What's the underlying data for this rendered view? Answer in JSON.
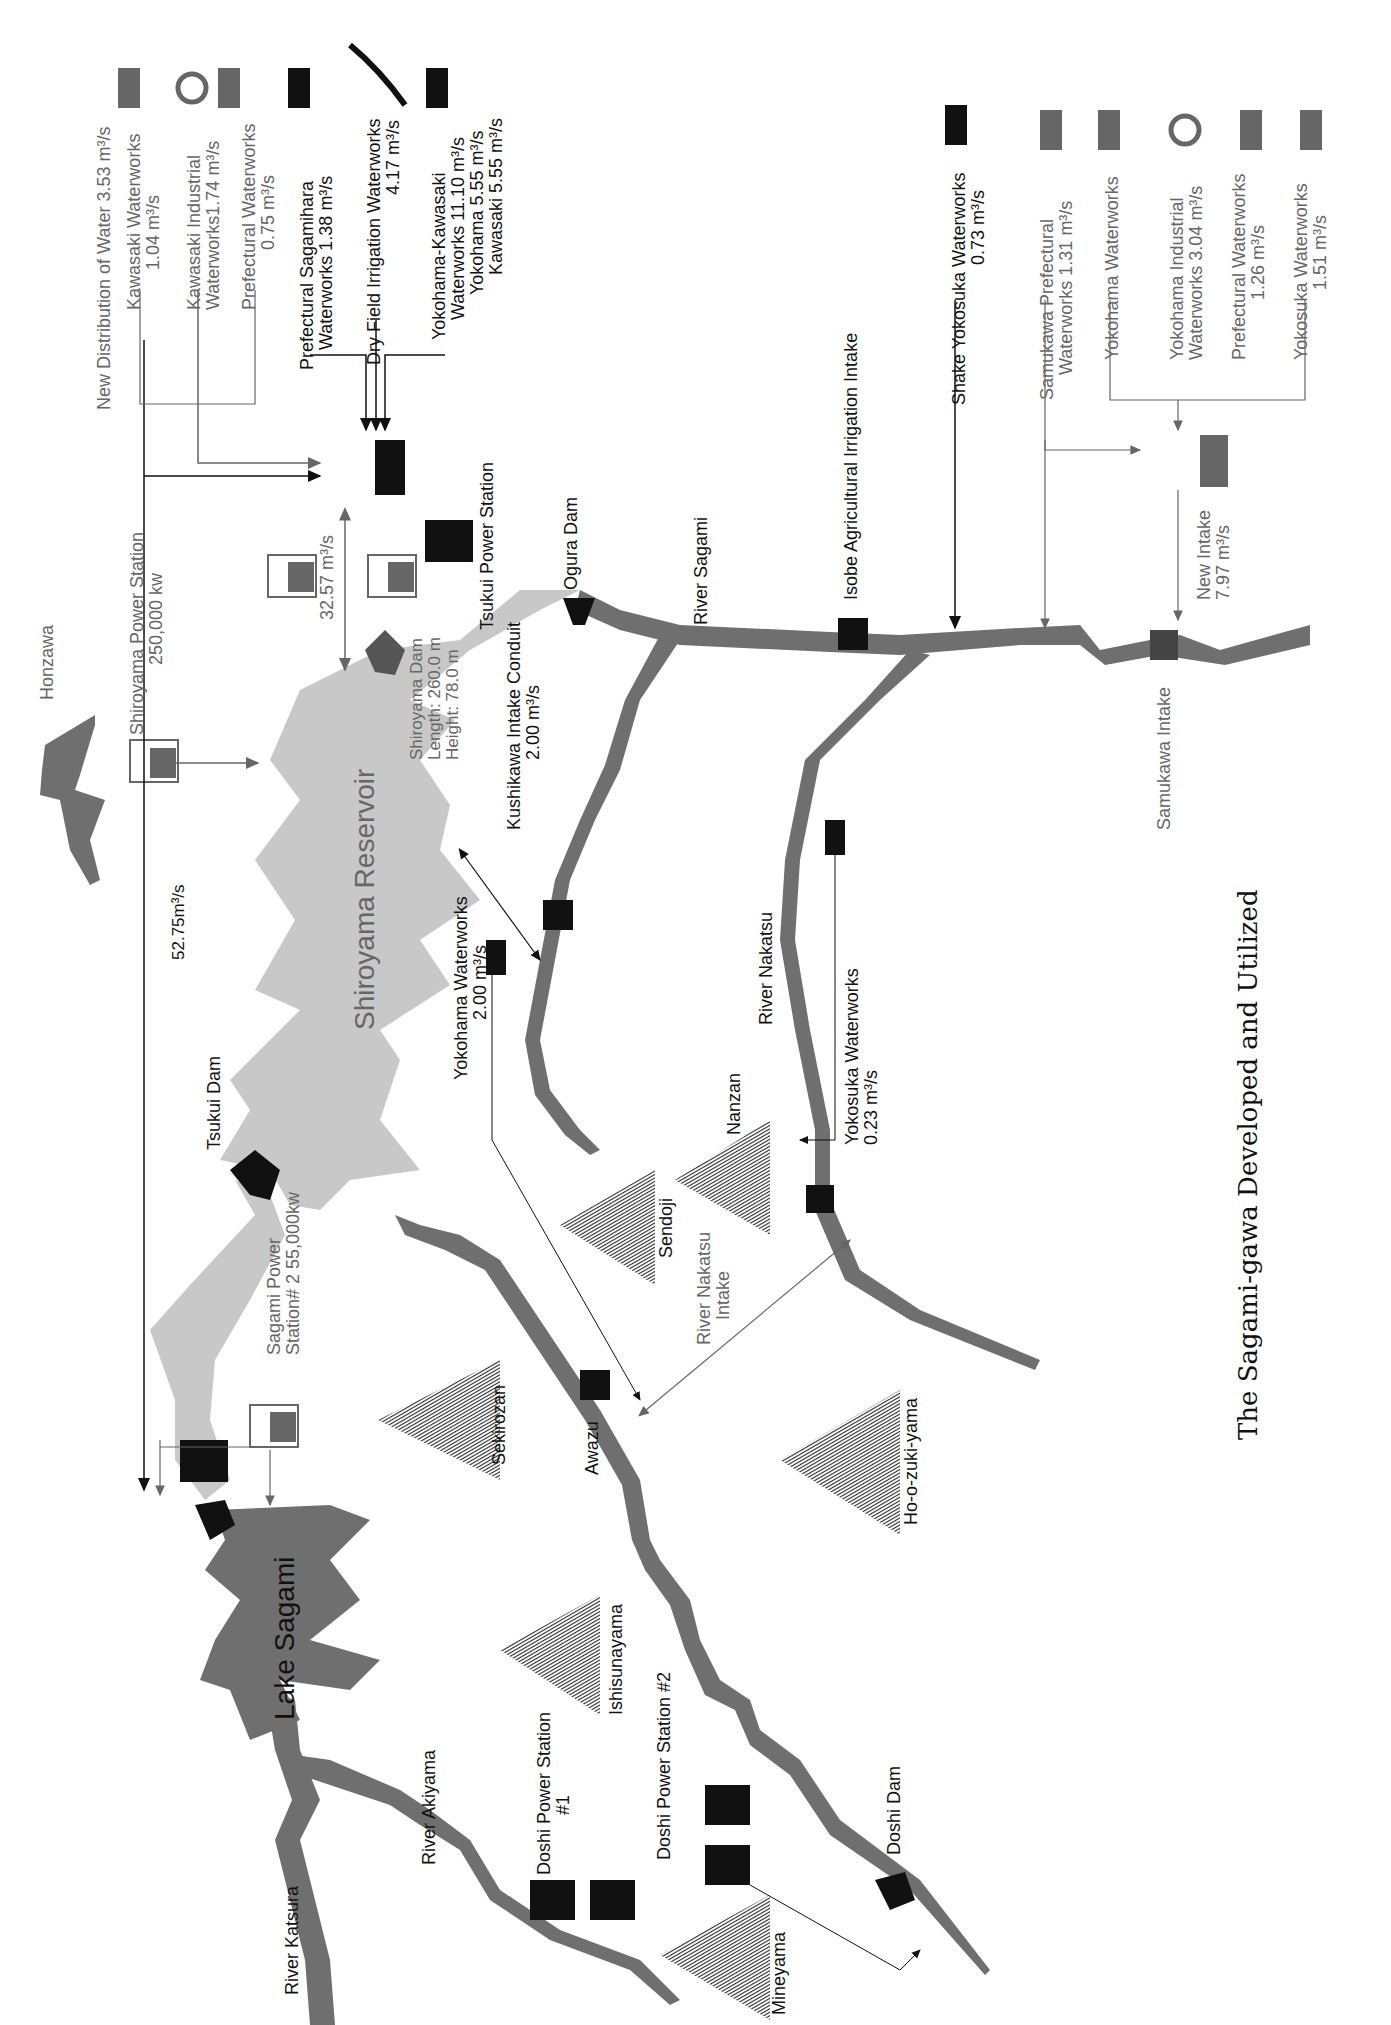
{
  "title": "The Sagami-gawa Developed and Utilized",
  "colors": {
    "river": "#6f6f6f",
    "reservoir": "#c8c8c8",
    "mountain": "#3a3a3a",
    "existing": "#111111",
    "planned": "#666666"
  },
  "water_bodies": {
    "lake_sagami": "Lake Sagami",
    "shiroyama_reservoir": "Shiroyama Reservoir",
    "honzawa": "Honzawa"
  },
  "rivers": {
    "sagami": "River Sagami",
    "nakatsu": "River Nakatsu",
    "katsura": "River Katsura",
    "akiyama": "River Akiyama"
  },
  "mountains": [
    "Sekirozan",
    "Sendoji",
    "Nanzan",
    "Ho-o-zuki-yama",
    "Ishisunayama",
    "Mineyama"
  ],
  "dams": {
    "tsukui": "Tsukui Dam",
    "ogura": "Ogura Dam",
    "doshi": "Doshi Dam",
    "shiroyama": {
      "name": "Shiroyama Dam",
      "length": "Length: 260.0 m",
      "height": "Height: 78.0 m"
    }
  },
  "power_stations": {
    "shiroyama": {
      "name": "Shiroyama Power Station",
      "capacity": "250,000 kw"
    },
    "tsukui": {
      "name": "Tsukui Power Station"
    },
    "sagami2": {
      "name": "Sagami Power",
      "line2": "Station# 2 55,000kw"
    },
    "doshi1": {
      "name": "Doshi Power Station",
      "line2": "#1"
    },
    "doshi2": {
      "name": "Doshi Power Station #2"
    }
  },
  "intakes": {
    "isobe": "Isobe Agricultural Irrigation Intake",
    "samukawa": "Samukawa Intake",
    "new_intake": {
      "name": "New Intake",
      "flow": "7.97 m³/s"
    },
    "kushikawa": {
      "name": "Kushikawa Intake Conduit",
      "flow": "2.00 m³/s"
    },
    "nakatsu": {
      "name": "River Nakatsu",
      "line2": "Intake"
    },
    "awazu": "Awazu"
  },
  "flows": {
    "tsukui_conduit": "52.75m³/s",
    "shiroyama_pump": "32.57 m³/s"
  },
  "distribution_upper": {
    "header": "New Distribution of Water 3.53 m³/s",
    "items": [
      {
        "name": "Kawasaki Waterworks",
        "flow": "1.04 m³/s",
        "icon": "faucet-icon",
        "status": "planned"
      },
      {
        "name": "Kawasaki Industrial",
        "flow": "Waterworks1.74 m³/s",
        "icon": "gear-icon",
        "status": "planned"
      },
      {
        "name": "Prefectural Waterworks",
        "flow": "0.75 m³/s",
        "icon": "faucet-icon",
        "status": "planned"
      },
      {
        "name": "Prefectural Sagamihara",
        "flow": "Waterworks 1.38 m³/s",
        "icon": "faucet-icon",
        "status": "existing"
      },
      {
        "name": "Dry Field Irrigation Waterworks",
        "flow": "4.17 m³/s",
        "icon": "rice-icon",
        "status": "existing"
      },
      {
        "name": "Yokohama-Kawasaki",
        "flow": "Waterworks 11.10 m³/s",
        "sub": [
          "Yokohama 5.55 m³/s",
          "Kawasaki 5.55 m³/s"
        ],
        "icon": "faucet-icon",
        "status": "existing"
      }
    ]
  },
  "distribution_lower": {
    "shake_yokosuka": {
      "name": "Shake Yokosuka Waterworks",
      "flow": "0.73 m³/s"
    },
    "items": [
      {
        "name": "Samukawa Prefectural",
        "flow": "Waterworks 1.31 m³/s",
        "icon": "faucet-icon"
      },
      {
        "name": "Yokohama Waterworks",
        "flow": "2.16 m³/s",
        "icon": "faucet-icon"
      },
      {
        "name": "Yokohama Industrial",
        "flow": "Waterworks 3.04 m³/s",
        "icon": "gear-icon"
      },
      {
        "name": "Prefectural Waterworks",
        "flow": "1.26 m³/s",
        "icon": "faucet-icon"
      },
      {
        "name": "Yokosuka Waterworks",
        "flow": "1.51 m³/s",
        "icon": "faucet-icon"
      }
    ]
  },
  "waterworks_other": {
    "yokohama": {
      "name": "Yokohama Waterworks",
      "flow": "2.00 m³/s"
    },
    "yokosuka": {
      "name": "Yokosuka Waterworks",
      "flow": "0.23 m³/s"
    }
  }
}
